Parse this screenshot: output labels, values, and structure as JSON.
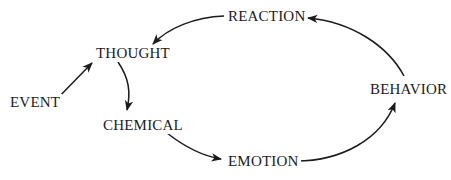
{
  "diagram": {
    "background_color": "#ffffff",
    "stroke_color": "#1b1b1b",
    "text_color": "#1b1b1b",
    "nodes": [
      {
        "id": "event",
        "label": "EVENT"
      },
      {
        "id": "thought",
        "label": "THOUGHT"
      },
      {
        "id": "chemical",
        "label": "CHEMICAL"
      },
      {
        "id": "reaction",
        "label": "REACTION"
      },
      {
        "id": "emotion",
        "label": "EMOTION"
      },
      {
        "id": "behavior",
        "label": "BEHAVIOR"
      }
    ],
    "edges": [
      {
        "id": "event-to-thought",
        "from": "EVENT",
        "to": "THOUGHT",
        "style": "straight-arrow"
      },
      {
        "id": "thought-to-chemical",
        "from": "THOUGHT",
        "to": "CHEMICAL",
        "style": "curved-arrow"
      },
      {
        "id": "chemical-to-emotion",
        "from": "CHEMICAL",
        "to": "EMOTION",
        "style": "curved-arrow"
      },
      {
        "id": "emotion-to-behavior",
        "from": "EMOTION",
        "to": "BEHAVIOR",
        "style": "curved-arrow"
      },
      {
        "id": "behavior-to-reaction",
        "from": "BEHAVIOR",
        "to": "REACTION",
        "style": "curved-arrow"
      },
      {
        "id": "reaction-to-thought",
        "from": "REACTION",
        "to": "THOUGHT",
        "style": "curved-arrow"
      }
    ]
  }
}
